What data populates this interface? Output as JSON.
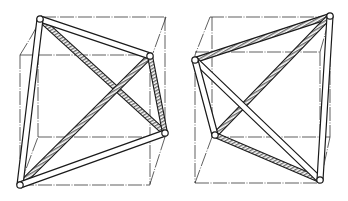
{
  "figure": {
    "background": "#ffffff",
    "ink": "#1a1a1a",
    "texture_color": "#8a8a8a",
    "panels": [
      {
        "id": "left",
        "cube_edges": [
          [
            42,
            17,
            166,
            17
          ],
          [
            166,
            17,
            153,
            53
          ],
          [
            20,
            55,
            153,
            55
          ],
          [
            20,
            55,
            31,
            37
          ],
          [
            31,
            37,
            42,
            17
          ],
          [
            20,
            55,
            20,
            185
          ],
          [
            38,
            137,
            165,
            137
          ],
          [
            165,
            17,
            165,
            137
          ],
          [
            165,
            137,
            150,
            184
          ],
          [
            20,
            185,
            150,
            185
          ],
          [
            150,
            55,
            150,
            185
          ],
          [
            38,
            137,
            38,
            55
          ],
          [
            20,
            185,
            38,
            137
          ]
        ],
        "vertices": {
          "A": [
            40,
            19
          ],
          "B": [
            150,
            56
          ],
          "C": [
            165,
            133
          ],
          "D": [
            20,
            185
          ]
        },
        "rods": [
          {
            "from": "A",
            "to": "B",
            "style": "plain"
          },
          {
            "from": "A",
            "to": "D",
            "style": "plain"
          },
          {
            "from": "D",
            "to": "C",
            "style": "plain"
          },
          {
            "from": "A",
            "to": "C",
            "style": "textured"
          },
          {
            "from": "D",
            "to": "B",
            "style": "textured"
          },
          {
            "from": "B",
            "to": "C",
            "style": "textured"
          }
        ]
      },
      {
        "id": "right",
        "cube_edges": [
          [
            210,
            17,
            330,
            17
          ],
          [
            210,
            17,
            195,
            55
          ],
          [
            195,
            52,
            320,
            52
          ],
          [
            320,
            52,
            330,
            17
          ],
          [
            330,
            17,
            330,
            137
          ],
          [
            212,
            17,
            212,
            137
          ],
          [
            212,
            137,
            330,
            137
          ],
          [
            195,
            183,
            320,
            183
          ],
          [
            195,
            183,
            212,
            137
          ],
          [
            195,
            55,
            195,
            183
          ],
          [
            320,
            52,
            320,
            183
          ],
          [
            320,
            183,
            330,
            137
          ]
        ],
        "vertices": {
          "P": [
            330,
            16
          ],
          "Q": [
            195,
            60
          ],
          "R": [
            215,
            135
          ],
          "S": [
            320,
            180
          ]
        },
        "rods": [
          {
            "from": "P",
            "to": "Q",
            "style": "textured"
          },
          {
            "from": "P",
            "to": "R",
            "style": "textured"
          },
          {
            "from": "R",
            "to": "S",
            "style": "textured"
          },
          {
            "from": "Q",
            "to": "S",
            "style": "plain"
          },
          {
            "from": "Q",
            "to": "R",
            "style": "plain"
          },
          {
            "from": "P",
            "to": "S",
            "style": "plain"
          }
        ]
      }
    ]
  }
}
